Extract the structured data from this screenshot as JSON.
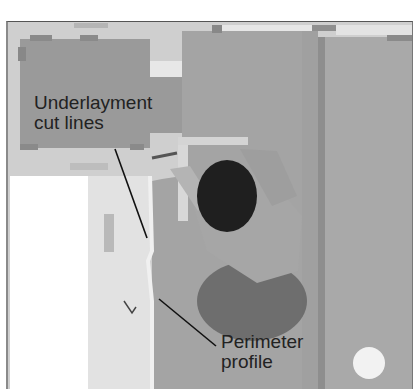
{
  "image": {
    "description": "Overhead photo of a person kneeling on a floor, tracing cut lines on underlayment sheets along a perimeter profile",
    "callouts": [
      {
        "label_line1": "Underlayment",
        "label_line2": "cut lines"
      },
      {
        "label_line1": "Perimeter",
        "label_line2": "profile"
      }
    ]
  }
}
